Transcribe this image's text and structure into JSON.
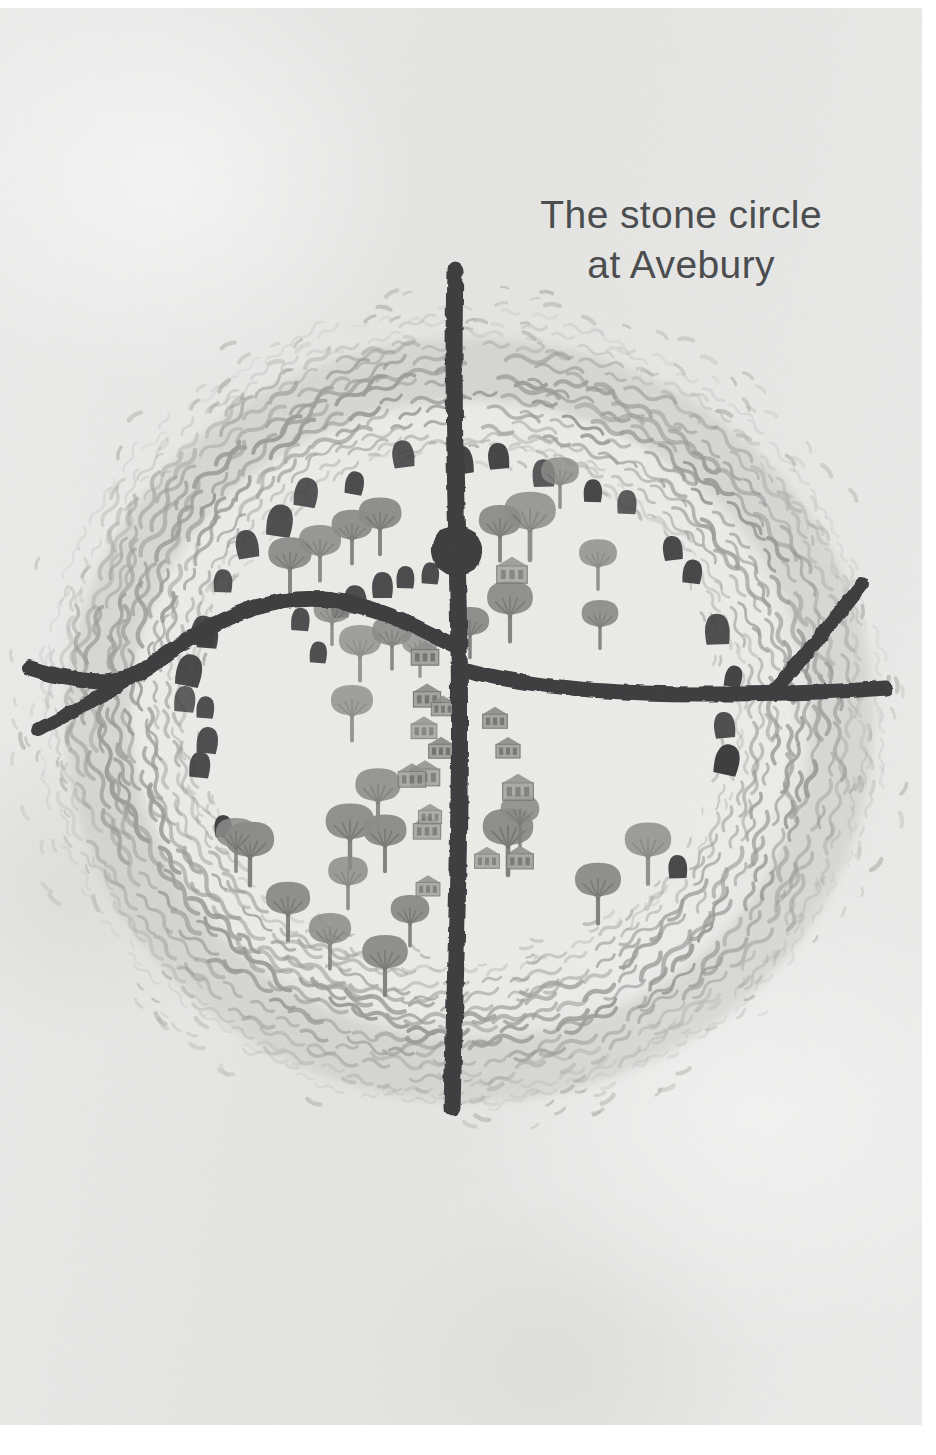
{
  "page": {
    "width": 936,
    "height": 1455,
    "background_color": "#ffffff",
    "paper_color": "#e6e7e4"
  },
  "title": {
    "line1": "The stone circle",
    "line2": "at Avebury",
    "color": "#4c4d4f",
    "align": "center",
    "position": "top-right"
  },
  "artwork": {
    "name": "avebury-stone-circle-map",
    "description": "Hand-drawn aerial map illustration of the Avebury henge: a large circular earthwork bank and ditch rendered in grey hatching, with a ring of dark standing stones inside it, a village of small houses and trees, and two dark roads crossing at the centre.",
    "colors": {
      "road": "#3a3a3c",
      "stone": "#3b3b3d",
      "bank_hatch": "#9b9c99",
      "bank_shadow": "#cfd0cc",
      "tree": "#8a8b88",
      "tree_dark": "#6f706d",
      "house": "#8e8f8c",
      "house_line": "#6e6f6c",
      "field": "#eceded"
    },
    "elements": {
      "henge_bank": "circular earthwork ring",
      "roads": [
        "north-south high street",
        "west road (forked)",
        "east road (forked)"
      ],
      "stone_circle_count": 30,
      "tree_count": 30,
      "house_count": 16
    }
  },
  "chart_data": {
    "type": "map",
    "title": "The stone circle at Avebury",
    "features": [
      {
        "name": "henge-bank",
        "kind": "earthwork-ring",
        "cx": 461,
        "cy": 700,
        "rx": 392,
        "ry": 370
      },
      {
        "name": "road-north-south",
        "kind": "road",
        "from": "north edge",
        "to": "south of henge"
      },
      {
        "name": "road-west",
        "kind": "road",
        "from": "centre",
        "to": "west edge (forked)"
      },
      {
        "name": "road-east",
        "kind": "road",
        "from": "centre",
        "to": "east edge (forked)"
      },
      {
        "name": "stone-circle",
        "kind": "megaliths",
        "count": 30
      },
      {
        "name": "village",
        "kind": "houses",
        "count": 16
      },
      {
        "name": "trees",
        "kind": "vegetation",
        "count": 30
      }
    ]
  }
}
